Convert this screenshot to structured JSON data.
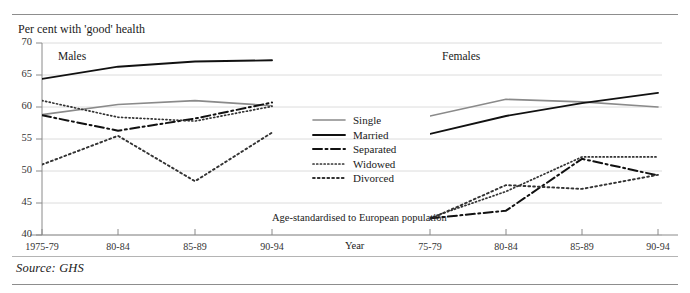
{
  "figure": {
    "y_axis_title": "Per cent with 'good' health",
    "x_axis_label": "Year",
    "axis_note": "Age-standardised to European population",
    "source": "Source: GHS",
    "panels": [
      {
        "title": "Males"
      },
      {
        "title": "Females"
      }
    ],
    "y_ticks": [
      "70",
      "65",
      "60",
      "55",
      "50",
      "45",
      "40"
    ],
    "x_ticks_left": [
      "1975-79",
      "80-84",
      "85-89",
      "90-94"
    ],
    "x_ticks_right": [
      "75-79",
      "80-84",
      "85-89",
      "90-94"
    ],
    "legend": [
      {
        "label": "Single",
        "style": "solid-grey",
        "color": "#8a8a8a"
      },
      {
        "label": "Married",
        "style": "solid-black",
        "color": "#111111"
      },
      {
        "label": "Separated",
        "style": "dash-dot",
        "color": "#111111"
      },
      {
        "label": "Widowed",
        "style": "fine-dot",
        "color": "#333333"
      },
      {
        "label": "Divorced",
        "style": "coarse-dot",
        "color": "#333333"
      }
    ]
  },
  "chart_data": {
    "type": "line",
    "title": "Per cent with 'good' health",
    "xlabel": "Year",
    "ylabel": "Per cent with 'good' health",
    "ylim": [
      40,
      70
    ],
    "ytick_values": [
      40,
      45,
      50,
      55,
      60,
      65,
      70
    ],
    "grid": "horizontal",
    "legend_position": "center",
    "annotation": "Age-standardised to European population",
    "source": "Source: GHS",
    "panels": [
      {
        "name": "Males",
        "categories": [
          "1975-79",
          "80-84",
          "85-89",
          "90-94"
        ],
        "series": [
          {
            "name": "Single",
            "values": [
              58.8,
              60.4,
              61.0,
              60.2
            ]
          },
          {
            "name": "Married",
            "values": [
              64.4,
              66.3,
              67.1,
              67.3
            ]
          },
          {
            "name": "Separated",
            "values": [
              58.7,
              56.3,
              58.2,
              60.7
            ]
          },
          {
            "name": "Widowed",
            "values": [
              61.0,
              58.4,
              57.8,
              60.1
            ]
          },
          {
            "name": "Divorced",
            "values": [
              51.0,
              55.5,
              48.4,
              56.0
            ]
          }
        ]
      },
      {
        "name": "Females",
        "categories": [
          "75-79",
          "80-84",
          "85-89",
          "90-94"
        ],
        "series": [
          {
            "name": "Single",
            "values": [
              58.6,
              61.2,
              60.8,
              60.0
            ]
          },
          {
            "name": "Married",
            "values": [
              55.8,
              58.6,
              60.6,
              62.2
            ]
          },
          {
            "name": "Separated",
            "values": [
              42.6,
              43.8,
              51.9,
              49.3
            ]
          },
          {
            "name": "Widowed",
            "values": [
              42.7,
              46.8,
              52.2,
              52.2
            ]
          },
          {
            "name": "Divorced",
            "values": [
              42.5,
              47.8,
              47.2,
              49.4
            ]
          }
        ]
      }
    ]
  }
}
